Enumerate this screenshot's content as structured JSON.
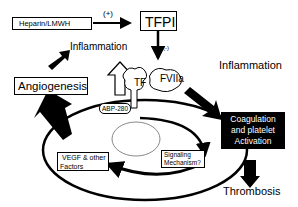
{
  "nodes": {
    "heparin": "Heparin/LMWH",
    "tfpi": "TFPI",
    "plus": "(+)",
    "minus": "(-)",
    "inflammation_left": "Inflammation",
    "angiogenesis": "Angiogenesis",
    "tf": "TF",
    "fviia": "FVIIa",
    "abp": "ABP-280",
    "vegf_line1": "VEGF & other",
    "vegf_line2": "Factors",
    "signaling_line1": "Signaling",
    "signaling_line2": "Mechanism?",
    "inflammation_right": "Inflammation",
    "coag_line1": "Coagulation",
    "coag_line2": "and platelet",
    "coag_line3": "Activation",
    "thrombosis": "Thrombosis"
  },
  "colors": {
    "ink": "#000000",
    "paper": "#ffffff"
  }
}
